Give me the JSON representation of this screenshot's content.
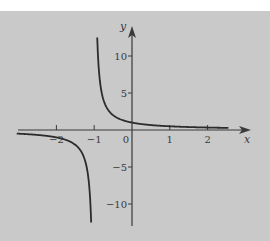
{
  "chart_data": {
    "type": "line",
    "title": "",
    "function": "y = 1/(x+1)",
    "xlabel": "x",
    "ylabel": "y",
    "xlim": [
      -3.0,
      3.1
    ],
    "ylim": [
      -13.5,
      14
    ],
    "x_ticks": [
      -2,
      -1,
      0,
      1,
      2
    ],
    "x_tick_labels": [
      "−2",
      "−1",
      "0",
      "1",
      "2"
    ],
    "y_ticks": [
      -10,
      -5,
      5,
      10
    ],
    "y_tick_labels": [
      "−10",
      "−5",
      "5",
      "10"
    ],
    "vertical_asymptote": -1,
    "horizontal_asymptote": 0,
    "series": [
      {
        "name": "left-branch",
        "x_range": [
          -3.05,
          -1.08
        ]
      },
      {
        "name": "right-branch",
        "x_range": [
          -0.92,
          2.55
        ]
      }
    ],
    "grid": false,
    "legend": "none",
    "colors": {
      "background": "#c9c9c9",
      "curve": "#2b2b2b",
      "axis": "#3a3a3a"
    }
  }
}
